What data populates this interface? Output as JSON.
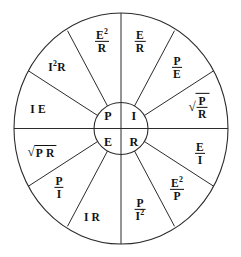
{
  "diagram": {
    "name": "ohms-law-wheel",
    "shape": "circle divided into twelve outer sectors around a four-quadrant hub",
    "stroke_color": "#2b2b2b",
    "text_color": "#111111",
    "background_color": "#ffffff"
  },
  "center": {
    "quadrants": [
      {
        "id": "power",
        "label": "P",
        "position": "top-left"
      },
      {
        "id": "current",
        "label": "I",
        "position": "top-right"
      },
      {
        "id": "voltage",
        "label": "E",
        "position": "bottom-left"
      },
      {
        "id": "resistance",
        "label": "R",
        "position": "bottom-right"
      }
    ]
  },
  "sectors": [
    {
      "id": "p-e2-over-r",
      "group": "power",
      "type": "fraction",
      "numerator": "E",
      "numerator_exponent": "2",
      "denominator": "R",
      "text": "E²/R"
    },
    {
      "id": "p-i2-r",
      "group": "power",
      "type": "product",
      "text": "I²R",
      "factors": [
        "I",
        "R"
      ],
      "first_exponent": "2"
    },
    {
      "id": "p-i-e",
      "group": "power",
      "type": "product",
      "text": "I E",
      "factors": [
        "I",
        "E"
      ]
    },
    {
      "id": "e-sqrt-p-r",
      "group": "voltage",
      "type": "sqrt-product",
      "text": "√(P R)",
      "factors": [
        "P",
        "R"
      ]
    },
    {
      "id": "e-p-over-i",
      "group": "voltage",
      "type": "fraction",
      "numerator": "P",
      "denominator": "I",
      "text": "P/I"
    },
    {
      "id": "e-i-r",
      "group": "voltage",
      "type": "product",
      "text": "I R",
      "factors": [
        "I",
        "R"
      ]
    },
    {
      "id": "r-p-over-i2",
      "group": "resistance",
      "type": "fraction",
      "numerator": "P",
      "denominator": "I",
      "denominator_exponent": "2",
      "text": "P/I²"
    },
    {
      "id": "r-e2-over-p",
      "group": "resistance",
      "type": "fraction",
      "numerator": "E",
      "numerator_exponent": "2",
      "denominator": "P",
      "text": "E²/P"
    },
    {
      "id": "r-e-over-i",
      "group": "resistance",
      "type": "fraction",
      "numerator": "E",
      "denominator": "I",
      "text": "E/I"
    },
    {
      "id": "i-sqrt-p-over-r",
      "group": "current",
      "type": "sqrt-fraction",
      "numerator": "P",
      "denominator": "R",
      "text": "√(P/R)"
    },
    {
      "id": "i-p-over-e",
      "group": "current",
      "type": "fraction",
      "numerator": "P",
      "denominator": "E",
      "text": "P/E"
    },
    {
      "id": "i-e-over-r",
      "group": "current",
      "type": "fraction",
      "numerator": "E",
      "denominator": "R",
      "text": "E/R"
    }
  ],
  "symbols": {
    "radical": "√",
    "exponent_two": "2"
  }
}
